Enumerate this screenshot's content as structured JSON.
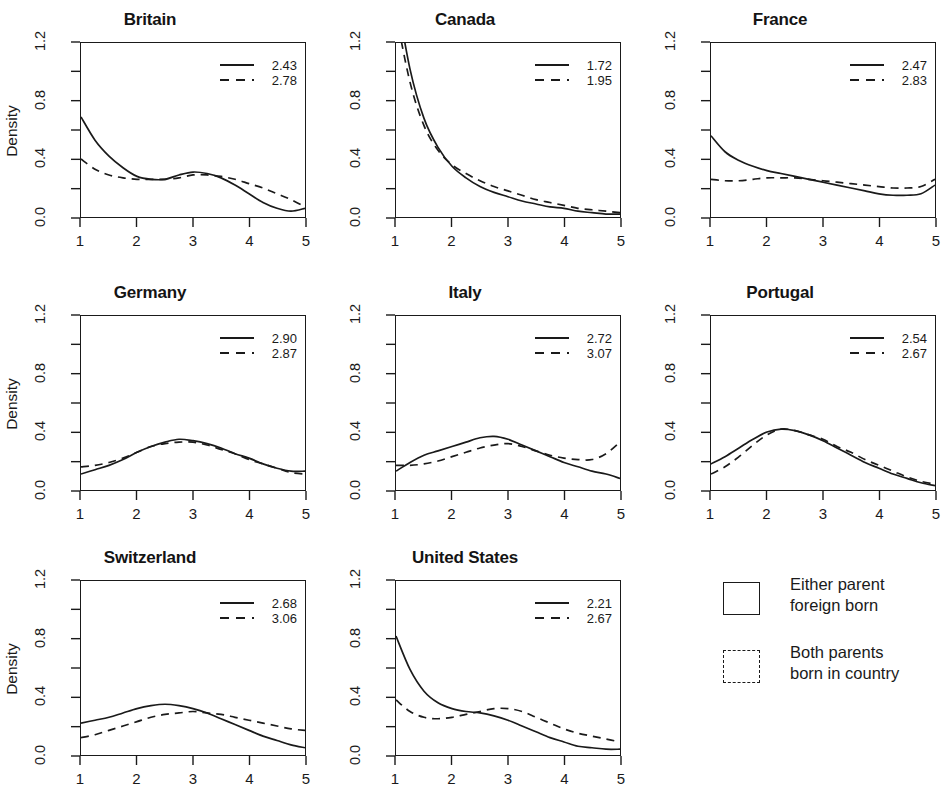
{
  "figure": {
    "title_clipped": "",
    "ylabel": "Density",
    "y_ticks": [
      "0.0",
      "0.4",
      "0.8",
      "1.2"
    ],
    "x_ticks": [
      "1",
      "2",
      "3",
      "4",
      "5"
    ],
    "legend": {
      "entries": [
        {
          "swatch": "solid-square-icon",
          "label": "Either parent\nforeign born"
        },
        {
          "swatch": "dashed-square-icon",
          "label": "Both parents\nborn in country"
        }
      ]
    }
  },
  "chart_data": {
    "type": "line",
    "title": "",
    "xlabel": "",
    "ylabel": "Density",
    "xlim": [
      1,
      5
    ],
    "ylim": [
      0.0,
      1.2
    ],
    "yticks": [
      0.0,
      0.4,
      0.8,
      1.2
    ],
    "xticks": [
      1,
      2,
      3,
      4,
      5
    ],
    "grid": false,
    "legend_position": "bottom-right-of-figure",
    "series_names": [
      "Either parent foreign born",
      "Both parents born in country"
    ],
    "series_styles": [
      "solid",
      "dashed"
    ],
    "panels": [
      {
        "name": "Britain",
        "means": {
          "solid": "2.43",
          "dashed": "2.78"
        },
        "x": [
          1.0,
          1.25,
          1.5,
          1.75,
          2.0,
          2.25,
          2.5,
          2.75,
          3.0,
          3.25,
          3.5,
          3.75,
          4.0,
          4.25,
          4.5,
          4.75,
          5.0
        ],
        "solid": [
          0.69,
          0.53,
          0.42,
          0.34,
          0.28,
          0.26,
          0.26,
          0.29,
          0.31,
          0.3,
          0.27,
          0.22,
          0.16,
          0.1,
          0.06,
          0.04,
          0.06
        ],
        "dashed": [
          0.4,
          0.33,
          0.29,
          0.27,
          0.26,
          0.26,
          0.26,
          0.27,
          0.29,
          0.29,
          0.28,
          0.26,
          0.23,
          0.2,
          0.16,
          0.12,
          0.07
        ]
      },
      {
        "name": "Canada",
        "means": {
          "solid": "1.72",
          "dashed": "1.95"
        },
        "x": [
          1.0,
          1.25,
          1.5,
          1.75,
          2.0,
          2.25,
          2.5,
          2.75,
          3.0,
          3.25,
          3.5,
          3.75,
          4.0,
          4.25,
          4.5,
          4.75,
          5.0
        ],
        "solid": [
          1.55,
          1.02,
          0.68,
          0.48,
          0.35,
          0.27,
          0.21,
          0.17,
          0.14,
          0.11,
          0.09,
          0.07,
          0.06,
          0.04,
          0.03,
          0.02,
          0.02
        ],
        "dashed": [
          1.4,
          0.93,
          0.63,
          0.46,
          0.36,
          0.3,
          0.25,
          0.21,
          0.18,
          0.15,
          0.12,
          0.1,
          0.08,
          0.06,
          0.05,
          0.04,
          0.03
        ]
      },
      {
        "name": "France",
        "means": {
          "solid": "2.47",
          "dashed": "2.83"
        },
        "x": [
          1.0,
          1.25,
          1.5,
          1.75,
          2.0,
          2.25,
          2.5,
          2.75,
          3.0,
          3.25,
          3.5,
          3.75,
          4.0,
          4.25,
          4.5,
          4.75,
          5.0
        ],
        "solid": [
          0.56,
          0.45,
          0.39,
          0.35,
          0.32,
          0.3,
          0.28,
          0.26,
          0.24,
          0.22,
          0.2,
          0.18,
          0.16,
          0.15,
          0.15,
          0.16,
          0.22
        ],
        "dashed": [
          0.26,
          0.25,
          0.25,
          0.26,
          0.27,
          0.27,
          0.27,
          0.26,
          0.25,
          0.24,
          0.23,
          0.22,
          0.21,
          0.2,
          0.2,
          0.21,
          0.26
        ]
      },
      {
        "name": "Germany",
        "means": {
          "solid": "2.90",
          "dashed": "2.87"
        },
        "x": [
          1.0,
          1.25,
          1.5,
          1.75,
          2.0,
          2.25,
          2.5,
          2.75,
          3.0,
          3.25,
          3.5,
          3.75,
          4.0,
          4.25,
          4.5,
          4.75,
          5.0
        ],
        "solid": [
          0.11,
          0.14,
          0.17,
          0.21,
          0.26,
          0.3,
          0.33,
          0.35,
          0.34,
          0.32,
          0.29,
          0.25,
          0.22,
          0.18,
          0.15,
          0.13,
          0.13
        ],
        "dashed": [
          0.16,
          0.17,
          0.19,
          0.22,
          0.26,
          0.3,
          0.32,
          0.33,
          0.33,
          0.31,
          0.28,
          0.25,
          0.21,
          0.18,
          0.15,
          0.12,
          0.11
        ]
      },
      {
        "name": "Italy",
        "means": {
          "solid": "2.72",
          "dashed": "3.07"
        },
        "x": [
          1.0,
          1.25,
          1.5,
          1.75,
          2.0,
          2.25,
          2.5,
          2.75,
          3.0,
          3.25,
          3.5,
          3.75,
          4.0,
          4.25,
          4.5,
          4.75,
          5.0
        ],
        "solid": [
          0.13,
          0.19,
          0.24,
          0.27,
          0.3,
          0.33,
          0.36,
          0.37,
          0.35,
          0.31,
          0.27,
          0.23,
          0.19,
          0.16,
          0.13,
          0.11,
          0.08
        ],
        "dashed": [
          0.17,
          0.17,
          0.18,
          0.2,
          0.23,
          0.26,
          0.29,
          0.31,
          0.32,
          0.3,
          0.27,
          0.24,
          0.22,
          0.21,
          0.21,
          0.25,
          0.33
        ]
      },
      {
        "name": "Portugal",
        "means": {
          "solid": "2.54",
          "dashed": "2.67"
        },
        "x": [
          1.0,
          1.25,
          1.5,
          1.75,
          2.0,
          2.25,
          2.5,
          2.75,
          3.0,
          3.25,
          3.5,
          3.75,
          4.0,
          4.25,
          4.5,
          4.75,
          5.0
        ],
        "solid": [
          0.18,
          0.23,
          0.29,
          0.35,
          0.4,
          0.42,
          0.41,
          0.38,
          0.34,
          0.29,
          0.24,
          0.19,
          0.15,
          0.11,
          0.08,
          0.05,
          0.03
        ],
        "dashed": [
          0.11,
          0.16,
          0.23,
          0.31,
          0.38,
          0.42,
          0.41,
          0.38,
          0.35,
          0.3,
          0.26,
          0.21,
          0.17,
          0.13,
          0.09,
          0.06,
          0.04
        ]
      },
      {
        "name": "Switzerland",
        "means": {
          "solid": "2.68",
          "dashed": "3.06"
        },
        "x": [
          1.0,
          1.25,
          1.5,
          1.75,
          2.0,
          2.25,
          2.5,
          2.75,
          3.0,
          3.25,
          3.5,
          3.75,
          4.0,
          4.25,
          4.5,
          4.75,
          5.0
        ],
        "solid": [
          0.22,
          0.24,
          0.26,
          0.29,
          0.32,
          0.34,
          0.35,
          0.34,
          0.32,
          0.29,
          0.25,
          0.21,
          0.17,
          0.13,
          0.1,
          0.07,
          0.05
        ],
        "dashed": [
          0.12,
          0.14,
          0.17,
          0.2,
          0.23,
          0.26,
          0.28,
          0.29,
          0.3,
          0.29,
          0.28,
          0.26,
          0.24,
          0.22,
          0.2,
          0.18,
          0.17
        ]
      },
      {
        "name": "United States",
        "means": {
          "solid": "2.21",
          "dashed": "2.67"
        },
        "x": [
          1.0,
          1.25,
          1.5,
          1.75,
          2.0,
          2.25,
          2.5,
          2.75,
          3.0,
          3.25,
          3.5,
          3.75,
          4.0,
          4.25,
          4.5,
          4.75,
          5.0
        ],
        "solid": [
          0.82,
          0.59,
          0.44,
          0.36,
          0.32,
          0.3,
          0.29,
          0.27,
          0.24,
          0.2,
          0.16,
          0.12,
          0.09,
          0.06,
          0.05,
          0.04,
          0.04
        ],
        "dashed": [
          0.38,
          0.3,
          0.26,
          0.25,
          0.26,
          0.28,
          0.3,
          0.32,
          0.32,
          0.3,
          0.26,
          0.22,
          0.18,
          0.15,
          0.13,
          0.11,
          0.09
        ]
      }
    ]
  }
}
